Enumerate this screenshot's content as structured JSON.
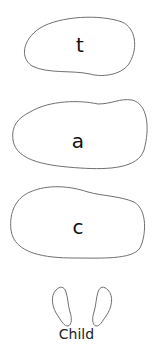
{
  "cards": [
    {
      "letter": "t"
    },
    {
      "letter": "a"
    },
    {
      "letter": "c"
    }
  ],
  "footer": {
    "icon": "footprints-icon",
    "label": "Child"
  },
  "colors": {
    "outline": "#707070",
    "text": "#111111"
  }
}
